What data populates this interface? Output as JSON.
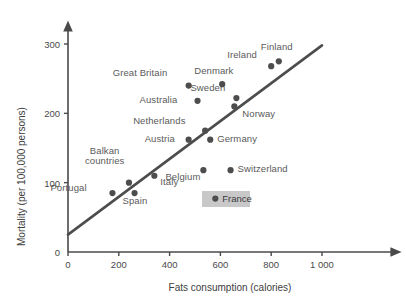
{
  "chart_data": {
    "type": "scatter",
    "title": "",
    "xlabel": "Fats consumption (calories)",
    "ylabel": "Mortality (per 100,000 persons)",
    "xlim": [
      0,
      1100
    ],
    "ylim": [
      0,
      330
    ],
    "xticks": [
      "0",
      "200",
      "400",
      "600",
      "800",
      "1 000"
    ],
    "xtick_values": [
      0,
      200,
      400,
      600,
      800,
      1000
    ],
    "yticks": [
      "0",
      "100",
      "200",
      "300"
    ],
    "ytick_values": [
      0,
      100,
      200,
      300
    ],
    "grid": false,
    "legend": "none",
    "points": [
      {
        "label": "Portugal",
        "x": 175,
        "y": 85,
        "label_dx": -62,
        "label_dy": -5
      },
      {
        "label": "Balkan countries",
        "x": 240,
        "y": 100,
        "label_dx": -44,
        "label_dy": -32
      },
      {
        "label": "Spain",
        "x": 262,
        "y": 85,
        "label_dx": -12,
        "label_dy": 8
      },
      {
        "label": "Italy",
        "x": 340,
        "y": 110,
        "label_dx": 6,
        "label_dy": 6
      },
      {
        "label": "Great Britain",
        "x": 475,
        "y": 240,
        "label_dx": -76,
        "label_dy": -13
      },
      {
        "label": "Australia",
        "x": 510,
        "y": 218,
        "label_dx": -58,
        "label_dy": -1
      },
      {
        "label": "Netherlands",
        "x": 540,
        "y": 175,
        "label_dx": -72,
        "label_dy": -10
      },
      {
        "label": "Austria",
        "x": 475,
        "y": 162,
        "label_dx": -44,
        "label_dy": -1
      },
      {
        "label": "Germany",
        "x": 560,
        "y": 162,
        "label_dx": 7,
        "label_dy": -1
      },
      {
        "label": "Denmark",
        "x": 607,
        "y": 242,
        "label_dx": -28,
        "label_dy": -13
      },
      {
        "label": "Sweden",
        "x": 663,
        "y": 222,
        "label_dx": -46,
        "label_dy": -10
      },
      {
        "label": "Norway",
        "x": 655,
        "y": 210,
        "label_dx": 8,
        "label_dy": 8
      },
      {
        "label": "Ireland",
        "x": 800,
        "y": 268,
        "label_dx": -44,
        "label_dy": -11
      },
      {
        "label": "Finland",
        "x": 830,
        "y": 275,
        "label_dx": -18,
        "label_dy": -14
      },
      {
        "label": "Belgium",
        "x": 533,
        "y": 118,
        "label_dx": -38,
        "label_dy": 7
      },
      {
        "label": "Switzerland",
        "x": 640,
        "y": 118,
        "label_dx": 7,
        "label_dy": -1
      },
      {
        "label": "France",
        "x": 580,
        "y": 77,
        "label_dx": 7,
        "label_dy": -1,
        "highlight": true
      }
    ],
    "trendline": {
      "x0": 0,
      "y0": 25,
      "x1": 1000,
      "y1": 298
    },
    "marker_color": "#4d4d4d",
    "line_color": "#4d4d4d",
    "axis_color": "#4a4a4a",
    "highlight_color": "#c8c8c8",
    "text_color": "#5a5a5a"
  }
}
